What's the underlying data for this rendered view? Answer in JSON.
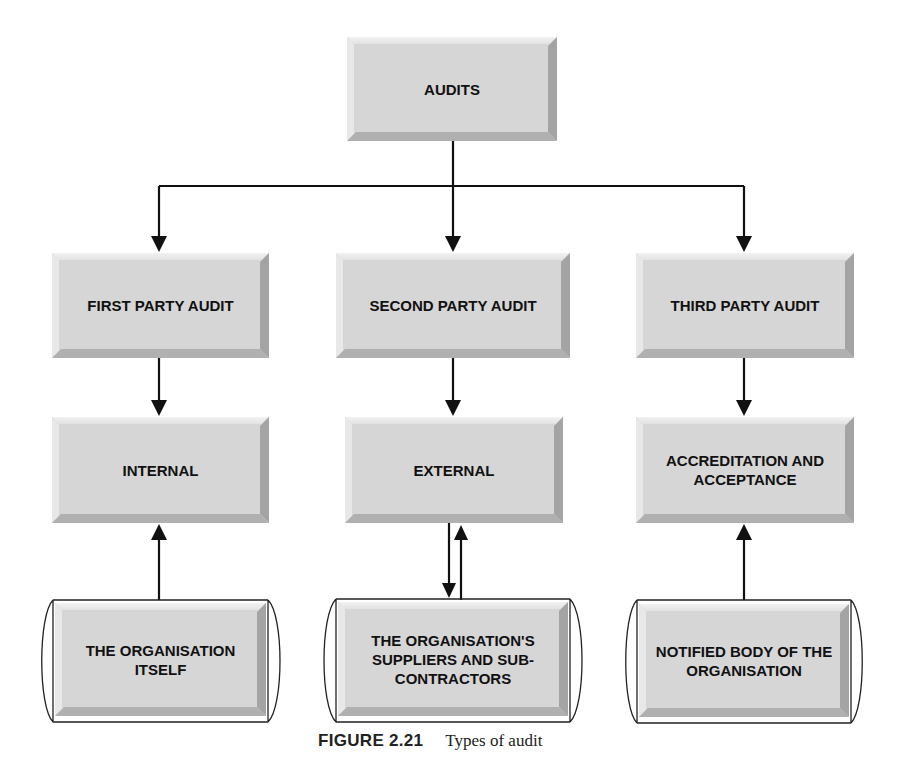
{
  "diagram": {
    "root": {
      "label": "AUDITS"
    },
    "columns": [
      {
        "type": {
          "label": "FIRST PARTY AUDIT"
        },
        "scope": {
          "label": "INTERNAL"
        },
        "auditee": {
          "label": "THE ORGANISATION ITSELF"
        },
        "auditee_link": "up"
      },
      {
        "type": {
          "label": "SECOND PARTY AUDIT"
        },
        "scope": {
          "label": "EXTERNAL"
        },
        "auditee": {
          "label": "THE ORGANISATION'S SUPPLIERS AND SUB-CONTRACTORS"
        },
        "auditee_link": "bidirectional"
      },
      {
        "type": {
          "label": "THIRD PARTY AUDIT"
        },
        "scope": {
          "label": "ACCREDITATION AND ACCEPTANCE"
        },
        "auditee": {
          "label": "NOTIFIED BODY OF THE ORGANISATION"
        },
        "auditee_link": "up"
      }
    ]
  },
  "caption": {
    "figure_number": "FIGURE 2.21",
    "title": "Types of audit"
  },
  "colors": {
    "box_fill": "#d6d6d6",
    "line": "#111111",
    "background": "#ffffff"
  }
}
